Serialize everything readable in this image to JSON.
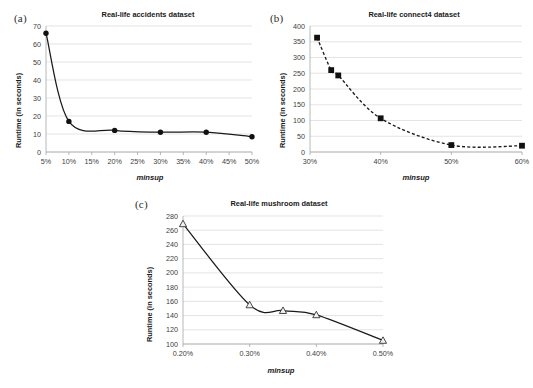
{
  "figure": {
    "panels": [
      {
        "key": "a",
        "label": "(a)",
        "title": "Real-life accidents dataset",
        "xlabel": "minsup",
        "ylabel": "Runtime (in seconds)"
      },
      {
        "key": "b",
        "label": "(b)",
        "title": "Real-life connect4 dataset",
        "xlabel": "minsup",
        "ylabel": "Runtime (in seconds)"
      },
      {
        "key": "c",
        "label": "(c)",
        "title": "Real-life mushroom dataset",
        "xlabel": "minsup",
        "ylabel": "Runtime (in seconds)"
      }
    ]
  },
  "chart_data": [
    {
      "type": "line",
      "panel": "a",
      "title": "Real-life accidents dataset",
      "xlabel": "minsup",
      "ylabel": "Runtime (in seconds)",
      "x": [
        5,
        10,
        20,
        30,
        40,
        50
      ],
      "x_tick_labels": [
        "5%",
        "10%",
        "15%",
        "20%",
        "25%",
        "30%",
        "35%",
        "40%",
        "45%",
        "50%"
      ],
      "x_ticks": [
        5,
        10,
        15,
        20,
        25,
        30,
        35,
        40,
        45,
        50
      ],
      "values": [
        66,
        17,
        12,
        11,
        11,
        8.5
      ],
      "y_tick_labels": [
        "0",
        "10",
        "20",
        "30",
        "40",
        "50",
        "60",
        "70"
      ],
      "y_ticks": [
        0,
        10,
        20,
        30,
        40,
        50,
        60,
        70
      ],
      "xlim": [
        5,
        50
      ],
      "ylim": [
        0,
        70
      ],
      "marker": "circle",
      "line_style": "solid",
      "grid": true,
      "legend": false
    },
    {
      "type": "line",
      "panel": "b",
      "title": "Real-life connect4 dataset",
      "xlabel": "minsup",
      "ylabel": "Runtime (in seconds)",
      "x": [
        31,
        33,
        34,
        40,
        50,
        60
      ],
      "x_tick_labels": [
        "30%",
        "40%",
        "50%",
        "60%"
      ],
      "x_ticks": [
        30,
        40,
        50,
        60
      ],
      "values": [
        363,
        260,
        243,
        107,
        22,
        20
      ],
      "y_tick_labels": [
        "0",
        "50",
        "100",
        "150",
        "200",
        "250",
        "300",
        "350",
        "400"
      ],
      "y_ticks": [
        0,
        50,
        100,
        150,
        200,
        250,
        300,
        350,
        400
      ],
      "xlim": [
        30,
        60
      ],
      "ylim": [
        0,
        400
      ],
      "marker": "square",
      "line_style": "dashed",
      "grid": true,
      "legend": false
    },
    {
      "type": "line",
      "panel": "c",
      "title": "Real-life mushroom dataset",
      "xlabel": "minsup",
      "ylabel": "Runtime (in seconds)",
      "x": [
        0.2,
        0.3,
        0.35,
        0.4,
        0.5
      ],
      "x_tick_labels": [
        "0.20%",
        "0.30%",
        "0.40%",
        "0.50%"
      ],
      "x_ticks": [
        0.2,
        0.3,
        0.4,
        0.5
      ],
      "values": [
        269,
        155,
        147,
        141,
        105
      ],
      "y_tick_labels": [
        "100",
        "120",
        "140",
        "160",
        "180",
        "200",
        "220",
        "240",
        "260",
        "280"
      ],
      "y_ticks": [
        100,
        120,
        140,
        160,
        180,
        200,
        220,
        240,
        260,
        280
      ],
      "xlim": [
        0.2,
        0.5
      ],
      "ylim": [
        100,
        280
      ],
      "marker": "triangle",
      "line_style": "solid",
      "grid": true,
      "legend": false
    }
  ]
}
